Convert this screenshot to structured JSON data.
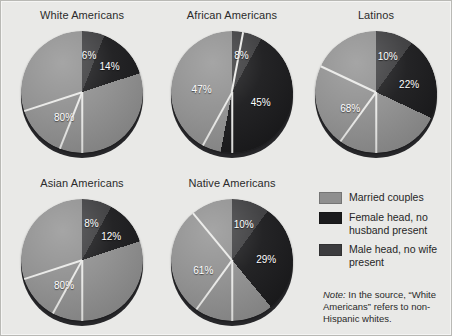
{
  "figure": {
    "background_color": "#e9e9e7",
    "border_color": "#b9b9b5"
  },
  "colors": {
    "married": "#8f8f8f",
    "female_head": "#1b1b1d",
    "male_head": "#3c3c3e"
  },
  "legend": {
    "items": [
      {
        "label": "Married couples",
        "color": "#8f8f8f",
        "swatch_name": "legend-swatch-married"
      },
      {
        "label": "Female head, no husband present",
        "color": "#1b1b1d",
        "swatch_name": "legend-swatch-female-head"
      },
      {
        "label": "Male head, no wife present",
        "color": "#3c3c3e",
        "swatch_name": "legend-swatch-male-head"
      }
    ]
  },
  "note": {
    "prefix": "Note:",
    "text": " In the source, “White Americans” refers to non-Hispanic whites."
  },
  "chart_data": {
    "type": "pie",
    "title": "",
    "legend_position": "right",
    "categories": [
      "Married couples",
      "Female head, no husband present",
      "Male head, no wife present"
    ],
    "series_colors": [
      "#8f8f8f",
      "#1b1b1d",
      "#3c3c3e"
    ],
    "value_unit": "percent",
    "charts": [
      {
        "title": "White Americans",
        "labels": [
          "80%",
          "14%",
          "6%"
        ],
        "values": [
          80,
          14,
          6
        ],
        "slices": [
          {
            "category": "Male head, no wife present",
            "value": 6,
            "label": "6%",
            "color": "#3c3c3e"
          },
          {
            "category": "Female head, no husband present",
            "value": 14,
            "label": "14%",
            "color": "#1b1b1d"
          },
          {
            "category": "Married couples",
            "value": 80,
            "label": "80%",
            "color": "#8f8f8f"
          }
        ]
      },
      {
        "title": "African Americans",
        "labels": [
          "47%",
          "45%",
          "8%"
        ],
        "values": [
          47,
          45,
          8
        ],
        "slices": [
          {
            "category": "Male head, no wife present",
            "value": 8,
            "label": "8%",
            "color": "#3c3c3e"
          },
          {
            "category": "Female head, no husband present",
            "value": 45,
            "label": "45%",
            "color": "#1b1b1d"
          },
          {
            "category": "Married couples",
            "value": 47,
            "label": "47%",
            "color": "#8f8f8f"
          }
        ]
      },
      {
        "title": "Latinos",
        "labels": [
          "68%",
          "22%",
          "10%"
        ],
        "values": [
          68,
          22,
          10
        ],
        "slices": [
          {
            "category": "Male head, no wife present",
            "value": 10,
            "label": "10%",
            "color": "#3c3c3e"
          },
          {
            "category": "Female head, no husband present",
            "value": 22,
            "label": "22%",
            "color": "#1b1b1d"
          },
          {
            "category": "Married couples",
            "value": 68,
            "label": "68%",
            "color": "#8f8f8f"
          }
        ]
      },
      {
        "title": "Asian Americans",
        "labels": [
          "80%",
          "12%",
          "8%"
        ],
        "values": [
          80,
          12,
          8
        ],
        "slices": [
          {
            "category": "Male head, no wife present",
            "value": 8,
            "label": "8%",
            "color": "#3c3c3e"
          },
          {
            "category": "Female head, no husband present",
            "value": 12,
            "label": "12%",
            "color": "#1b1b1d"
          },
          {
            "category": "Married couples",
            "value": 80,
            "label": "80%",
            "color": "#8f8f8f"
          }
        ]
      },
      {
        "title": "Native Americans",
        "labels": [
          "61%",
          "29%",
          "10%"
        ],
        "values": [
          61,
          29,
          10
        ],
        "slices": [
          {
            "category": "Male head, no wife present",
            "value": 10,
            "label": "10%",
            "color": "#3c3c3e"
          },
          {
            "category": "Female head, no husband present",
            "value": 29,
            "label": "29%",
            "color": "#1b1b1d"
          },
          {
            "category": "Married couples",
            "value": 61,
            "label": "61%",
            "color": "#8f8f8f"
          }
        ]
      }
    ]
  },
  "layout": {
    "positions": [
      {
        "left": 6,
        "top": 4
      },
      {
        "left": 156,
        "top": 4
      },
      {
        "left": 300,
        "top": 4
      },
      {
        "left": 6,
        "top": 172
      },
      {
        "left": 156,
        "top": 172
      }
    ]
  }
}
